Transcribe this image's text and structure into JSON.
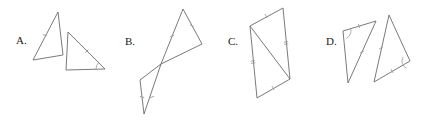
{
  "sheet": {
    "title": "Triangle congruence multiple-choice figures",
    "background_color": "#ffffff",
    "width": 422,
    "height": 122,
    "line_color": "#6b6b6b",
    "mark_color": "#9a9a9a",
    "label_color": "#1a1a1a"
  },
  "choices": [
    {
      "key": "A",
      "label": "A.",
      "label_x": 16,
      "label_y": 44,
      "description": "Two separate triangles, one upper-left and one lower-right, with a single tick on one side of each and an angle arc",
      "shapes": [
        {
          "name": "triangle-a-left",
          "points": "58,12 63,55 33,60"
        },
        {
          "name": "triangle-a-right",
          "points": "68,32 105,69 66,70"
        }
      ],
      "marks": [
        {
          "type": "tick",
          "name": "tick-a-left-side",
          "x": 45,
          "y": 35,
          "angle": -83,
          "count": 1
        },
        {
          "type": "tick",
          "name": "tick-a-right-side",
          "x": 87,
          "y": 51,
          "angle": 45,
          "count": 1
        },
        {
          "type": "arc",
          "name": "arc-a-right-vertex",
          "x": 105,
          "y": 69,
          "r": 9,
          "start": 180,
          "end": 225
        }
      ]
    },
    {
      "key": "B",
      "label": "B.",
      "label_x": 125,
      "label_y": 45,
      "description": "Two triangles meeting tip to tip forming a bowtie, each with a tick on the shared-direction sides",
      "shapes": [
        {
          "name": "triangle-b-upper",
          "points": "183,9 202,44 161,64"
        },
        {
          "name": "triangle-b-lower",
          "points": "140,80 161,64 144,114"
        }
      ],
      "marks": [
        {
          "type": "tick",
          "name": "tick-b-upper-left-side",
          "x": 172,
          "y": 36,
          "angle": 68,
          "count": 1
        },
        {
          "type": "tick",
          "name": "tick-b-upper-apex",
          "x": 192,
          "y": 26,
          "angle": 118,
          "count": 1
        },
        {
          "type": "tick",
          "name": "tick-b-lower-side",
          "x": 152,
          "y": 97,
          "angle": 72,
          "count": 1
        },
        {
          "type": "tick",
          "name": "tick-b-lower-base",
          "x": 142,
          "y": 97,
          "angle": 105,
          "count": 1
        }
      ]
    },
    {
      "key": "C",
      "label": "C.",
      "label_x": 228,
      "label_y": 45,
      "description": "A parallelogram split by a diagonal into two triangles, with single ticks on the top and bottom sides and double ticks on the left and right sides",
      "shapes": [
        {
          "name": "parallelogram-c",
          "points": "250,26 283,8 290,79 257,98"
        },
        {
          "name": "diagonal-c",
          "points": "250,26 290,79"
        }
      ],
      "marks": [
        {
          "type": "tick",
          "name": "tick-c-top-side",
          "x": 266,
          "y": 16,
          "angle": -29,
          "count": 1
        },
        {
          "type": "tick",
          "name": "tick-c-bottom-side",
          "x": 273,
          "y": 88,
          "angle": -30,
          "count": 1
        },
        {
          "type": "tick",
          "name": "tick-c-left-side",
          "x": 253,
          "y": 62,
          "angle": 80,
          "count": 2
        },
        {
          "type": "tick",
          "name": "tick-c-right-side",
          "x": 286,
          "y": 43,
          "angle": 84,
          "count": 2
        }
      ]
    },
    {
      "key": "D",
      "label": "D.",
      "label_x": 326,
      "label_y": 45,
      "description": "Two slanted triangles side by side, each with a tick on two sides and an angle arc at a corresponding vertex",
      "shapes": [
        {
          "name": "triangle-d-left",
          "points": "343,31 376,21 348,83"
        },
        {
          "name": "triangle-d-right",
          "points": "389,15 410,61 374,82"
        }
      ],
      "marks": [
        {
          "type": "tick",
          "name": "tick-d-left-top-side",
          "x": 359,
          "y": 26,
          "angle": -17,
          "count": 1
        },
        {
          "type": "tick",
          "name": "tick-d-left-diagonal",
          "x": 362,
          "y": 52,
          "angle": 66,
          "count": 1
        },
        {
          "type": "arc",
          "name": "arc-d-left-vertex",
          "x": 343,
          "y": 31,
          "r": 8,
          "start": -17,
          "end": 65
        },
        {
          "type": "tick",
          "name": "tick-d-right-left-side",
          "x": 381,
          "y": 48,
          "angle": 62,
          "count": 1
        },
        {
          "type": "tick",
          "name": "tick-d-right-base",
          "x": 392,
          "y": 71,
          "angle": -30,
          "count": 1
        },
        {
          "type": "arc",
          "name": "arc-d-right-vertex",
          "x": 410,
          "y": 61,
          "r": 8,
          "start": 115,
          "end": 210
        }
      ]
    }
  ]
}
